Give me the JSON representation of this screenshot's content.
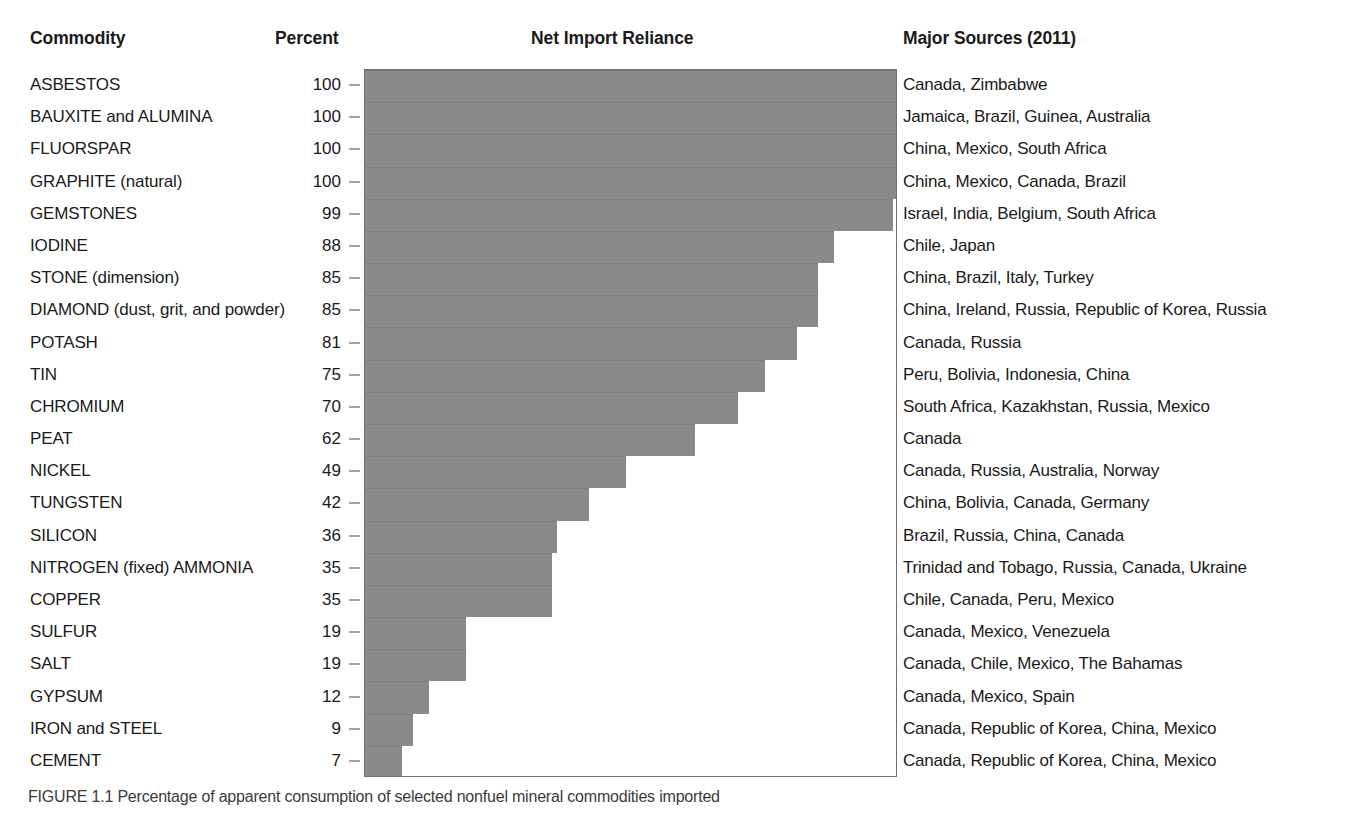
{
  "header": {
    "commodity": "Commodity",
    "percent": "Percent",
    "net_import_reliance": "Net Import Reliance",
    "major_sources": "Major Sources (2011)"
  },
  "caption": "FIGURE 1.1 Percentage of apparent consumption of selected nonfuel mineral commodities imported",
  "colors": {
    "bar_fill": "#8a8a8a",
    "plot_border": "#6f6f6f",
    "text": "#1a1a1a"
  },
  "chart_data": {
    "type": "bar",
    "orientation": "horizontal",
    "title": "Net Import Reliance",
    "xlabel": "Percent",
    "ylabel": "Commodity",
    "xlim": [
      0,
      100
    ],
    "grid": false,
    "legend": null,
    "categories": [
      "ASBESTOS",
      "BAUXITE and ALUMINA",
      "FLUORSPAR",
      "GRAPHITE (natural)",
      "GEMSTONES",
      "IODINE",
      "STONE (dimension)",
      "DIAMOND (dust, grit, and powder)",
      "POTASH",
      "TIN",
      "CHROMIUM",
      "PEAT",
      "NICKEL",
      "TUNGSTEN",
      "SILICON",
      "NITROGEN (fixed) AMMONIA",
      "COPPER",
      "SULFUR",
      "SALT",
      "GYPSUM",
      "IRON and STEEL",
      "CEMENT"
    ],
    "values": [
      100,
      100,
      100,
      100,
      99,
      88,
      85,
      85,
      81,
      75,
      70,
      62,
      49,
      42,
      36,
      35,
      35,
      19,
      19,
      12,
      9,
      7
    ],
    "sources": [
      "Canada, Zimbabwe",
      "Jamaica, Brazil, Guinea, Australia",
      "China, Mexico, South Africa",
      "China, Mexico, Canada, Brazil",
      "Israel, India, Belgium, South Africa",
      "Chile, Japan",
      "China, Brazil, Italy, Turkey",
      "China, Ireland, Russia, Republic of Korea, Russia",
      "Canada, Russia",
      "Peru, Bolivia, Indonesia, China",
      "South Africa, Kazakhstan, Russia, Mexico",
      "Canada",
      "Canada, Russia, Australia, Norway",
      "China, Bolivia, Canada, Germany",
      "Brazil, Russia, China, Canada",
      "Trinidad and Tobago, Russia, Canada, Ukraine",
      "Chile, Canada, Peru, Mexico",
      "Canada, Mexico, Venezuela",
      "Canada, Chile, Mexico, The Bahamas",
      "Canada, Mexico, Spain",
      "Canada, Republic of Korea, China, Mexico",
      "Canada, Republic of Korea, China, Mexico"
    ]
  }
}
